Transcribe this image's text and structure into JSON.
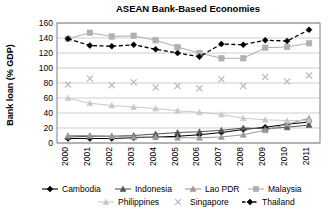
{
  "chart_data": {
    "type": "line",
    "title": "ASEAN Bank-Based Economies",
    "xlabel": "",
    "ylabel": "Bank loan (% GDP)",
    "ylim": [
      0,
      160
    ],
    "yticks": [
      0,
      20,
      40,
      60,
      80,
      100,
      120,
      140,
      160
    ],
    "grid": true,
    "legend_position": "bottom",
    "categories": [
      "2000",
      "2001",
      "2002",
      "2003",
      "2004",
      "2005",
      "2006",
      "2007",
      "2008",
      "2009",
      "2010",
      "2011"
    ],
    "series": [
      {
        "name": "Cambodia",
        "color": "#000000",
        "marker": "diamond",
        "dash": "solid",
        "values": [
          6,
          6,
          6,
          7,
          8,
          9,
          11,
          14,
          18,
          21,
          25,
          28
        ]
      },
      {
        "name": "Indonesia",
        "color": "#555555",
        "marker": "triangle",
        "dash": "solid",
        "values": [
          8,
          9,
          9,
          10,
          12,
          14,
          15,
          17,
          20,
          19,
          21,
          24
        ]
      },
      {
        "name": "Lao PDR",
        "color": "#999999",
        "marker": "triangle",
        "dash": "solid",
        "values": [
          10,
          10,
          9,
          8,
          8,
          7,
          7,
          8,
          11,
          17,
          25,
          33
        ]
      },
      {
        "name": "Malaysia",
        "color": "#b0b0b0",
        "marker": "square",
        "dash": "solid",
        "values": [
          139,
          147,
          142,
          143,
          137,
          128,
          120,
          113,
          113,
          127,
          128,
          133
        ]
      },
      {
        "name": "Philippines",
        "color": "#c8c8c8",
        "marker": "triangle",
        "dash": "solid",
        "values": [
          60,
          53,
          50,
          48,
          46,
          43,
          41,
          38,
          33,
          31,
          30,
          30
        ]
      },
      {
        "name": "Singapore",
        "color": "#bcbcbc",
        "marker": "cross",
        "dash": "none",
        "values": [
          78,
          86,
          77,
          81,
          74,
          76,
          73,
          85,
          76,
          88,
          82,
          90
        ]
      },
      {
        "name": "Thailand",
        "color": "#000000",
        "marker": "diamond",
        "dash": "dashed",
        "values": [
          139,
          130,
          129,
          131,
          125,
          120,
          115,
          132,
          131,
          137,
          136,
          151
        ]
      }
    ]
  },
  "legend": {
    "items": [
      {
        "label": "Cambodia"
      },
      {
        "label": "Indonesia"
      },
      {
        "label": "Lao PDR"
      },
      {
        "label": "Malaysia"
      },
      {
        "label": "Philippines"
      },
      {
        "label": "Singapore"
      },
      {
        "label": "Thailand"
      }
    ]
  }
}
